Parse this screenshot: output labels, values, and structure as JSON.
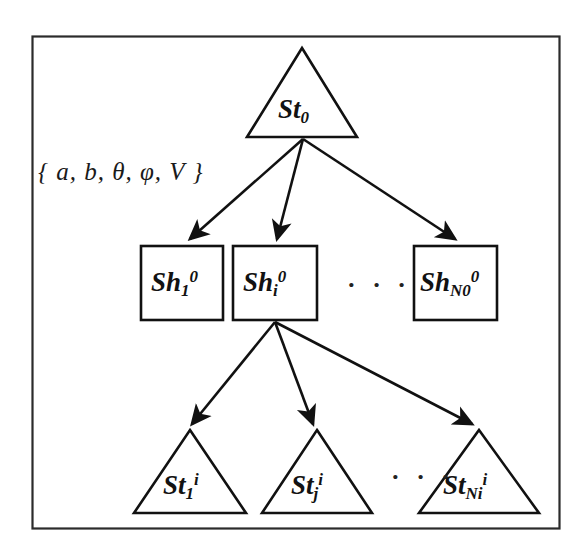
{
  "figure": {
    "kind": "hierarchical-tree-diagram",
    "frame": {
      "present": true,
      "color": "#2b2b2b"
    },
    "background": "#ffffff",
    "ink_color": "#111111"
  },
  "edge_label": {
    "text": "{ a, b, θ, φ, V }",
    "open_brace": "{",
    "close_brace": "}",
    "parameters": [
      "a",
      "b",
      "θ",
      "φ",
      "V"
    ],
    "separator": ","
  },
  "levels": [
    {
      "name": "root-level",
      "shape": "triangle",
      "nodes": [
        {
          "id": "st0",
          "base": "St",
          "sub": "0",
          "sup": "",
          "full": "St₀"
        }
      ]
    },
    {
      "name": "sheet-level",
      "shape": "square",
      "ellipsis": "· · ·",
      "nodes": [
        {
          "id": "sh1",
          "base": "Sh",
          "sub": "1",
          "sup": "0",
          "full": "Sh₁⁰"
        },
        {
          "id": "shi",
          "base": "Sh",
          "sub": "i",
          "sup": "0",
          "full": "Shᵢ⁰"
        },
        {
          "id": "shn0",
          "base": "Sh",
          "sub": "N0",
          "sup": "0",
          "full": "Sh_N0⁰"
        }
      ]
    },
    {
      "name": "state-level",
      "shape": "triangle",
      "ellipsis": "· · ·",
      "nodes": [
        {
          "id": "st1i",
          "base": "St",
          "sub": "1",
          "sup": "i",
          "full": "St₁ⁱ"
        },
        {
          "id": "stji",
          "base": "St",
          "sub": "j",
          "sup": "i",
          "full": "St_jⁱ"
        },
        {
          "id": "stnii",
          "base": "St",
          "sub": "Ni",
          "sup": "i",
          "full": "St_Niⁱ"
        }
      ]
    }
  ],
  "edges": {
    "from_root": {
      "count": 3,
      "style": "arrow",
      "targets": [
        "sh1",
        "shi",
        "shn0"
      ]
    },
    "from_shi": {
      "count": 3,
      "style": "arrow",
      "targets": [
        "st1i",
        "stji",
        "stnii"
      ]
    }
  }
}
